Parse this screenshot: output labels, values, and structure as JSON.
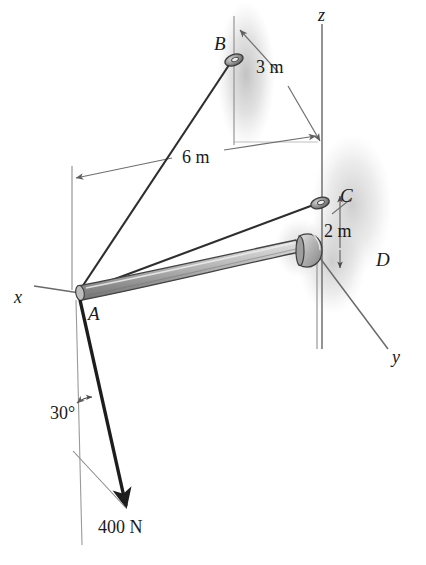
{
  "figure": {
    "type": "statics-free-body-diagram",
    "background_color": "#ffffff",
    "ink_color": "#2b2b2b",
    "thin_line_color": "#6e6e6e",
    "shadow_color": "#b9b9b9",
    "boom_top_color": "#c9c9c9",
    "boom_bottom_color": "#8c8c8c"
  },
  "points": {
    "A": {
      "label": "A",
      "x": 78,
      "y": 292,
      "note": "free end of boom where cables and load attach"
    },
    "B": {
      "label": "B",
      "x": 234,
      "y": 60,
      "note": "upper cable anchor eyelet"
    },
    "C": {
      "label": "C",
      "x": 320,
      "y": 203,
      "note": "lower cable anchor eyelet"
    },
    "D": {
      "label": "D",
      "x": 318,
      "y": 253,
      "note": "ball-and-socket support at wall"
    }
  },
  "axes": [
    {
      "name": "z",
      "label": "z",
      "label_x": 318,
      "label_y": 8,
      "orientation": "vertical-up"
    },
    {
      "name": "y",
      "label": "y",
      "label_x": 396,
      "label_y": 353,
      "orientation": "down-right"
    },
    {
      "name": "x",
      "label": "x",
      "label_x": 16,
      "label_y": 290,
      "orientation": "left"
    }
  ],
  "dimensions": [
    {
      "label": "3 m",
      "value": 3,
      "unit": "m",
      "label_x": 256,
      "label_y": 62,
      "measures": "horizontal distance from B to the z axis"
    },
    {
      "label": "6 m",
      "value": 6,
      "unit": "m",
      "label_x": 182,
      "label_y": 152,
      "measures": "horizontal distance from A to the z axis"
    },
    {
      "label": "2 m",
      "value": 2,
      "unit": "m",
      "label_x": 326,
      "label_y": 228,
      "measures": "vertical distance from D up to C"
    }
  ],
  "angles": [
    {
      "label": "30°",
      "value": 30,
      "unit": "deg",
      "label_x": 52,
      "label_y": 408,
      "measures": "angle of the 400 N force from the vertical"
    }
  ],
  "forces": [
    {
      "label": "400 N",
      "magnitude": 400,
      "unit": "N",
      "label_x": 100,
      "label_y": 524,
      "applied_at": "A",
      "direction": "down and to the right, 30 degrees from vertical"
    }
  ],
  "members": [
    {
      "name": "boom-AD",
      "from": "A",
      "to": "D",
      "style": "tapered-solid-cylinder"
    },
    {
      "name": "cable-AB",
      "from": "A",
      "to": "B",
      "style": "thin-solid-line"
    },
    {
      "name": "cable-AC",
      "from": "A",
      "to": "C",
      "style": "thin-solid-line"
    }
  ]
}
